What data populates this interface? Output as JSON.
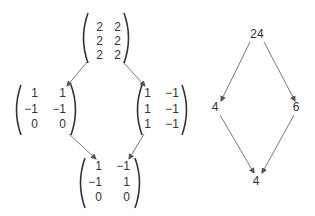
{
  "matrix_lattice": {
    "top": {
      "rows": [
        [
          "2",
          "2"
        ],
        [
          "2",
          "2"
        ],
        [
          "2",
          "2"
        ]
      ]
    },
    "left": {
      "rows": [
        [
          "1",
          "1"
        ],
        [
          "−1",
          "−1"
        ],
        [
          "0",
          "0"
        ]
      ]
    },
    "right": {
      "rows": [
        [
          "1",
          "−1"
        ],
        [
          "1",
          "−1"
        ],
        [
          "1",
          "−1"
        ]
      ]
    },
    "bottom": {
      "rows": [
        [
          "1",
          "−1"
        ],
        [
          "−1",
          "1"
        ],
        [
          "0",
          "0"
        ]
      ]
    },
    "edges": [
      {
        "from": "top",
        "to": "left"
      },
      {
        "from": "top",
        "to": "right"
      },
      {
        "from": "left",
        "to": "bottom"
      },
      {
        "from": "right",
        "to": "bottom"
      }
    ]
  },
  "number_lattice": {
    "top": "24",
    "left": "4",
    "right": "6",
    "bottom": "4",
    "edges": [
      {
        "from": "top",
        "to": "left"
      },
      {
        "from": "top",
        "to": "right"
      },
      {
        "from": "left",
        "to": "bottom"
      },
      {
        "from": "right",
        "to": "bottom"
      }
    ]
  },
  "colors": {
    "text": "#333333",
    "edge": "#555555",
    "background": "#ffffff"
  }
}
